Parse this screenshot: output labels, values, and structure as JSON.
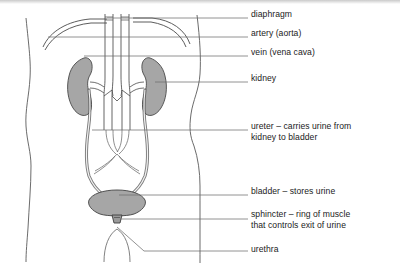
{
  "figure": {
    "view": "anterior torso cross-section"
  },
  "colors": {
    "organ_fill": "#a6a6a6",
    "organ_stroke": "#4a4a4a",
    "vessel_fill": "#ffffff",
    "outline": "#5a5a5a",
    "leader_line": "#6e6e6e",
    "text": "#1b1b1b",
    "background": "#ffffff"
  },
  "labels": [
    {
      "id": "diaphragm",
      "lines": [
        "diaphragm"
      ],
      "x": 251,
      "y": 14,
      "dash": "—"
    },
    {
      "id": "artery-aorta",
      "lines": [
        "artery (aorta)"
      ],
      "x": 251,
      "y": 33,
      "dash": "—"
    },
    {
      "id": "vein-vena-cava",
      "lines": [
        "vein (vena cava)"
      ],
      "x": 251,
      "y": 52,
      "dash": "—"
    },
    {
      "id": "kidney",
      "lines": [
        "kidney"
      ],
      "x": 251,
      "y": 78,
      "dash": "—"
    },
    {
      "id": "ureter",
      "lines": [
        "ureter – carries urine from",
        "kidney to bladder"
      ],
      "x": 251,
      "y": 126,
      "dash": "—"
    },
    {
      "id": "bladder",
      "lines": [
        "bladder – stores urine"
      ],
      "x": 251,
      "y": 191,
      "dash": "—"
    },
    {
      "id": "sphincter",
      "lines": [
        "sphincter – ring of muscle",
        "that controls exit of urine"
      ],
      "x": 251,
      "y": 214,
      "dash": "—"
    },
    {
      "id": "urethra",
      "lines": [
        "urethra"
      ],
      "x": 251,
      "y": 249,
      "dash": "—"
    }
  ],
  "structures": [
    {
      "id": "torso-outline",
      "name": "torso body outline",
      "filled": false
    },
    {
      "id": "diaphragm-curve",
      "name": "diaphragm dome",
      "filled": false
    },
    {
      "id": "aorta",
      "name": "artery (aorta)",
      "filled": false
    },
    {
      "id": "vena-cava",
      "name": "vein (vena cava)",
      "filled": false
    },
    {
      "id": "kidney-left",
      "name": "left kidney",
      "filled": true
    },
    {
      "id": "kidney-right",
      "name": "right kidney",
      "filled": true
    },
    {
      "id": "ureter-left",
      "name": "left ureter",
      "filled": true
    },
    {
      "id": "ureter-right",
      "name": "right ureter",
      "filled": true
    },
    {
      "id": "bladder",
      "name": "bladder",
      "filled": true
    },
    {
      "id": "sphincter",
      "name": "sphincter",
      "filled": true
    },
    {
      "id": "urethra",
      "name": "urethra",
      "filled": false
    },
    {
      "id": "pelvic-vessels",
      "name": "iliac vessels",
      "filled": false
    }
  ]
}
